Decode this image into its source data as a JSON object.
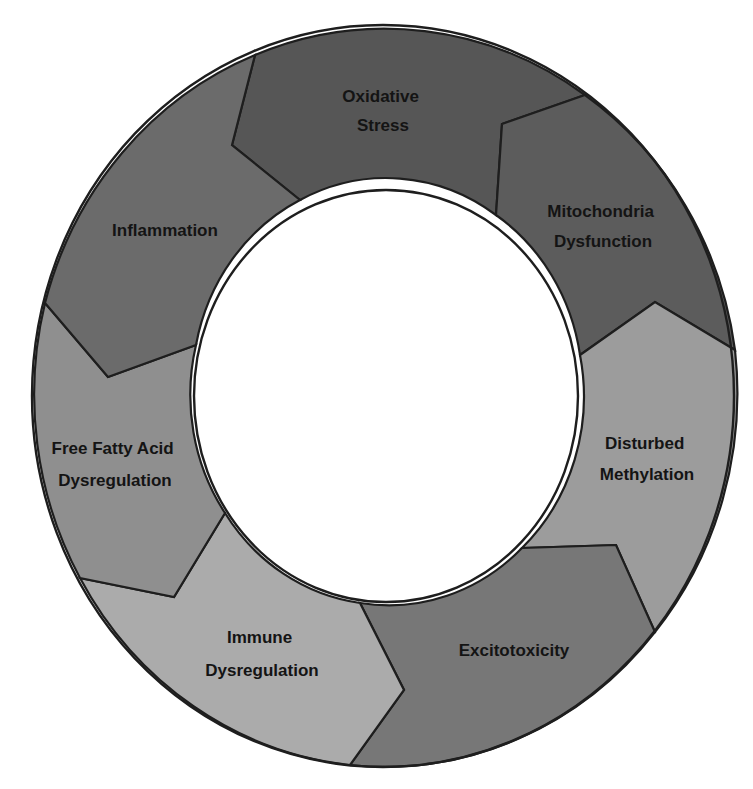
{
  "diagram": {
    "type": "cycle",
    "direction": "counter-clockwise",
    "segments": [
      {
        "id": "oxidative-stress",
        "lines": [
          "Oxidative",
          "Stress"
        ],
        "color": "#565656"
      },
      {
        "id": "mitochondria-dysfunction",
        "lines": [
          "Mitochondria",
          "Dysfunction"
        ],
        "color": "#5c5c5c"
      },
      {
        "id": "disturbed-methylation",
        "lines": [
          "Disturbed",
          "Methylation"
        ],
        "color": "#9c9c9c"
      },
      {
        "id": "excitotoxicity",
        "lines": [
          "Excitotoxicity"
        ],
        "color": "#777777"
      },
      {
        "id": "immune-dysregulation",
        "lines": [
          "Immune",
          "Dysregulation"
        ],
        "color": "#ababab"
      },
      {
        "id": "free-fatty-acid-dysregulation",
        "lines": [
          "Free Fatty Acid",
          "Dysregulation"
        ],
        "color": "#8f8f8f"
      },
      {
        "id": "inflammation",
        "lines": [
          "Inflammation"
        ],
        "color": "#6b6b6b"
      }
    ]
  }
}
